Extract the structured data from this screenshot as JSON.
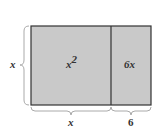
{
  "diagram": {
    "colors": {
      "fill": "#c9c9c9",
      "stroke": "#333333",
      "brace": "#aaaaaa"
    },
    "regions": [
      {
        "id": "square",
        "label_base": "x",
        "label_exp": "2"
      },
      {
        "id": "strip",
        "label": "6x"
      }
    ],
    "side_labels": {
      "left": "x",
      "bottom_left": "x",
      "bottom_right": "6"
    }
  }
}
